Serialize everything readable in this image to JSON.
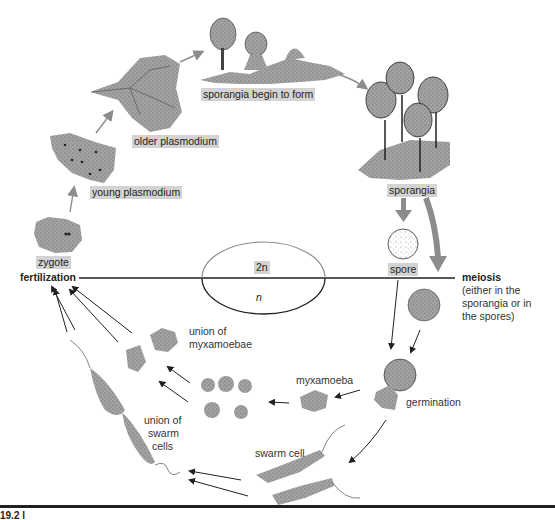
{
  "diagram": {
    "type": "life-cycle",
    "ploidy": {
      "diploid": "2n",
      "haploid": "n"
    },
    "stages": {
      "zygote": "zygote",
      "young_plasmodium": "young plasmodium",
      "older_plasmodium": "older plasmodium",
      "sporangia_begin": "sporangia begin to form",
      "sporangia": "sporangia",
      "spore": "spore",
      "germination": "germination",
      "myxamoeba": "myxamoeba",
      "swarm_cell": "swarm cell",
      "union_myxamoebae_1": "union of",
      "union_myxamoebae_2": "myxamoebae",
      "union_swarm_1": "union of",
      "union_swarm_2": "swarm",
      "union_swarm_3": "cells"
    },
    "processes": {
      "fertilization": "fertilization",
      "meiosis": "meiosis",
      "meiosis_note_1": "(either in the",
      "meiosis_note_2": "sporangia or in",
      "meiosis_note_3": "the spores)"
    },
    "figure_label": "19.2 l"
  },
  "colors": {
    "label_bg": "#d3d3d3",
    "cell_fill": "#9a9a9a",
    "arrow_gray": "#8c8c8c",
    "arrow_black": "#231f20"
  }
}
